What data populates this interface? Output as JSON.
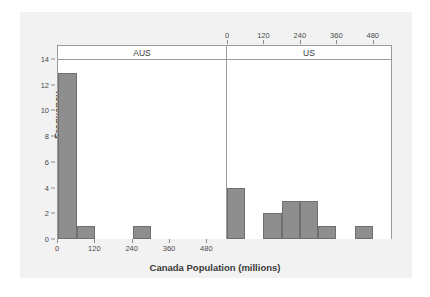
{
  "chart_data": {
    "type": "bar",
    "title": "",
    "subtitle": "",
    "xlabel": "Canada Population (millions)",
    "ylabel": "Frequency",
    "ylim": [
      0,
      14
    ],
    "xlim": [
      0,
      540
    ],
    "grid": false,
    "legend": null,
    "bin_width": 60,
    "panel_variable": "Country",
    "panels": [
      {
        "name": "AUS",
        "axis_position": "bottom",
        "xticks": [
          0,
          120,
          240,
          360,
          480
        ],
        "xtick_labels": [
          "0",
          "120",
          "240",
          "360",
          "480"
        ],
        "bins": [
          {
            "start": 0,
            "end": 60,
            "value": 13
          },
          {
            "start": 60,
            "end": 120,
            "value": 1
          },
          {
            "start": 120,
            "end": 180,
            "value": 0
          },
          {
            "start": 180,
            "end": 240,
            "value": 0
          },
          {
            "start": 240,
            "end": 300,
            "value": 1
          },
          {
            "start": 300,
            "end": 360,
            "value": 0
          },
          {
            "start": 360,
            "end": 420,
            "value": 0
          },
          {
            "start": 420,
            "end": 480,
            "value": 0
          },
          {
            "start": 480,
            "end": 540,
            "value": 0
          }
        ]
      },
      {
        "name": "US",
        "axis_position": "top",
        "xticks": [
          0,
          120,
          240,
          360,
          480
        ],
        "xtick_labels": [
          "0",
          "120",
          "240",
          "360",
          "480"
        ],
        "bins": [
          {
            "start": 0,
            "end": 60,
            "value": 4
          },
          {
            "start": 60,
            "end": 120,
            "value": 0
          },
          {
            "start": 120,
            "end": 180,
            "value": 2
          },
          {
            "start": 180,
            "end": 240,
            "value": 3
          },
          {
            "start": 240,
            "end": 300,
            "value": 3
          },
          {
            "start": 300,
            "end": 360,
            "value": 1
          },
          {
            "start": 360,
            "end": 420,
            "value": 0
          },
          {
            "start": 420,
            "end": 480,
            "value": 1
          },
          {
            "start": 480,
            "end": 540,
            "value": 0
          }
        ]
      }
    ],
    "yticks": [
      0,
      2,
      4,
      6,
      8,
      10,
      12,
      14
    ],
    "ytick_labels": [
      "0",
      "2",
      "4",
      "6",
      "8",
      "10",
      "12",
      "14"
    ],
    "colors": {
      "bar_fill": "#8e8e8e",
      "bar_border": "#6f6f6f",
      "frame": "#9a9a9a",
      "panel_background": "#f2f2f2",
      "plot_background": "#ffffff",
      "text": "#3a3a3a"
    }
  }
}
